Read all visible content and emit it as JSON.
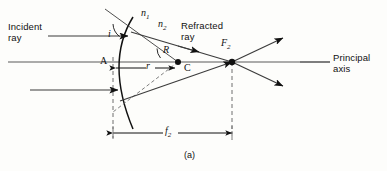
{
  "figure": {
    "caption": "(a)",
    "background_color": "#fdfdfb",
    "ink_color": "#111111"
  },
  "labels": {
    "incident_ray_line1": "Incident",
    "incident_ray_line2": "ray",
    "refracted_ray_line1": "Refracted",
    "refracted_ray_line2": "ray",
    "principal_axis_line1": "Principal",
    "principal_axis_line2": "axis",
    "angle_of_incidence": "i",
    "angle_of_refraction": "R",
    "index_medium_1": "n",
    "index_medium_1_sub": "1",
    "index_medium_2": "n",
    "index_medium_2_sub": "2",
    "vertex_point": "A",
    "center_of_curvature": "C",
    "radius": "r",
    "focal_point": "F",
    "focal_point_sub": "2",
    "focal_length": "f",
    "focal_length_sub": "2"
  },
  "geometry": {
    "principal_axis_y": 62,
    "vertex_x": 113,
    "center_c_x": 178,
    "focal_point_x": 232,
    "radius_px": 65,
    "focal_length_px": 119,
    "arc_top_y": 18,
    "arc_bottom_y": 128,
    "incident_ray_upper_y": 36,
    "incident_ray_lower_y": 90,
    "dimension_line_y": 133
  }
}
